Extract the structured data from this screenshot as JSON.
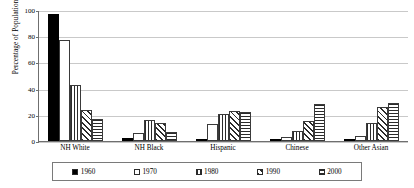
{
  "chart_data": {
    "type": "bar",
    "title": "",
    "xlabel": "",
    "ylabel": "Percentage of Population",
    "categories": [
      "NH White",
      "NH Black",
      "Hispanic",
      "Chinese",
      "Other Asian"
    ],
    "series": [
      {
        "name": "1960",
        "pattern": "solid-black",
        "values": [
          97,
          2,
          1,
          1,
          1
        ]
      },
      {
        "name": "1970",
        "pattern": "white-empty",
        "values": [
          77,
          6,
          13,
          3,
          4
        ]
      },
      {
        "name": "1980",
        "pattern": "vertical-stripes",
        "values": [
          43,
          16,
          21,
          8,
          14
        ]
      },
      {
        "name": "1990",
        "pattern": "diagonal-stripes",
        "values": [
          24,
          14,
          23,
          15,
          26
        ]
      },
      {
        "name": "2000",
        "pattern": "horizontal-stripes",
        "values": [
          17,
          7,
          22,
          28,
          29
        ]
      }
    ],
    "ylim": [
      0,
      100
    ],
    "yticks": [
      0,
      20,
      40,
      60,
      80,
      100
    ],
    "ytick_labels": [
      "0",
      "20",
      "40",
      "60",
      "80",
      "100"
    ],
    "grid": true,
    "legend_position": "bottom"
  },
  "colors": {
    "axis": "#6f6f6f",
    "grid": "#c9c9c9",
    "bar_outline": "#2b2b2b",
    "solid_fill": "#000000",
    "background": "#ffffff"
  }
}
